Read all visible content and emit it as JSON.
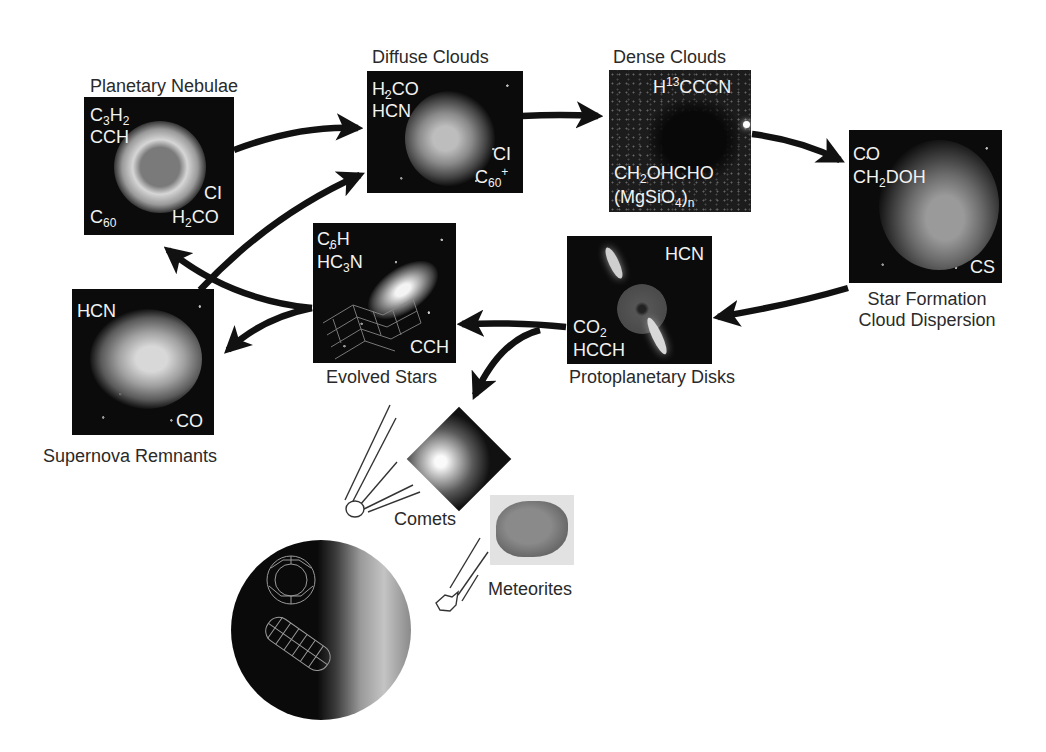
{
  "diagram": {
    "type": "cycle-of-cosmic-matter",
    "nodes": [
      {
        "id": "planetary-nebulae",
        "title": "Planetary Nebulae",
        "molecules": {
          "top_left_1": {
            "base": "C",
            "sub1": "3",
            "base2": "H",
            "sub2": "2",
            "text": "C3H2"
          },
          "top_left_2": "CCH",
          "bottom_right_1": "CI",
          "bottom_right_2": {
            "pre": "H",
            "sub": "2",
            "post": "CO",
            "text": "H2CO"
          },
          "bottom_left": {
            "base": "C",
            "sub": "60",
            "text": "C60"
          }
        }
      },
      {
        "id": "diffuse-clouds",
        "title": "Diffuse Clouds",
        "molecules": {
          "top_left_1": {
            "pre": "H",
            "sub": "2",
            "post": "CO",
            "text": "H2CO"
          },
          "top_left_2": "HCN",
          "bottom_right_1": "CI",
          "bottom_right_2": {
            "base": "C",
            "sub": "60",
            "sup": "+",
            "text": "C60+"
          }
        }
      },
      {
        "id": "dense-clouds",
        "title": "Dense Clouds",
        "molecules": {
          "top_right": {
            "pre": "H",
            "sup": "13",
            "post": "CCCN",
            "text": "H13CCCN"
          },
          "bottom_left_1": {
            "pre": "CH",
            "sub": "2",
            "post": "OHCHO",
            "text": "CH2OHCHO"
          },
          "bottom_left_2": {
            "pre": "(MgSiO",
            "sub": "4",
            "post": ")",
            "sub2": "n",
            "text": "(MgSiO4)n"
          }
        }
      },
      {
        "id": "star-formation",
        "title_line1": "Star Formation",
        "title_line2": "Cloud Dispersion",
        "molecules": {
          "top_left_1": "CO",
          "top_left_2": {
            "pre": "CH",
            "sub": "2",
            "post": "DOH",
            "text": "CH2DOH"
          },
          "bottom_right": "CS"
        }
      },
      {
        "id": "protoplanetary-disks",
        "title": "Protoplanetary Disks",
        "molecules": {
          "top_right": "HCN",
          "bottom_left_1": {
            "pre": "CO",
            "sub": "2",
            "text": "CO2"
          },
          "bottom_left_2": "HCCH"
        }
      },
      {
        "id": "evolved-stars",
        "title": "Evolved Stars",
        "molecules": {
          "top_left_1": {
            "pre": "C",
            "sub": "6",
            "post": "H",
            "text": "C6H"
          },
          "top_left_2": {
            "pre": "HC",
            "sub": "3",
            "post": "N",
            "text": "HC3N"
          },
          "bottom_right": "CCH"
        }
      },
      {
        "id": "supernova-remnants",
        "title": "Supernova Remnants",
        "molecules": {
          "top_left": "HCN",
          "bottom_right": "CO"
        }
      },
      {
        "id": "comets",
        "title": "Comets"
      },
      {
        "id": "meteorites",
        "title": "Meteorites"
      },
      {
        "id": "earth",
        "title": ""
      }
    ],
    "edges": [
      {
        "from": "planetary-nebulae",
        "to": "diffuse-clouds"
      },
      {
        "from": "supernova-remnants",
        "to": "diffuse-clouds"
      },
      {
        "from": "diffuse-clouds",
        "to": "dense-clouds"
      },
      {
        "from": "dense-clouds",
        "to": "star-formation"
      },
      {
        "from": "star-formation",
        "to": "protoplanetary-disks"
      },
      {
        "from": "protoplanetary-disks",
        "to": "evolved-stars"
      },
      {
        "from": "protoplanetary-disks",
        "to": "comets"
      },
      {
        "from": "evolved-stars",
        "to": "planetary-nebulae"
      },
      {
        "from": "evolved-stars",
        "to": "supernova-remnants"
      },
      {
        "from": "comets",
        "to": "earth"
      },
      {
        "from": "meteorites",
        "to": "earth"
      }
    ],
    "colors": {
      "background": "#ffffff",
      "panel": "#0b0b0b",
      "arrow": "#111111",
      "label": "#2a2a2a",
      "molecule_text": "#f2f2f2"
    }
  }
}
